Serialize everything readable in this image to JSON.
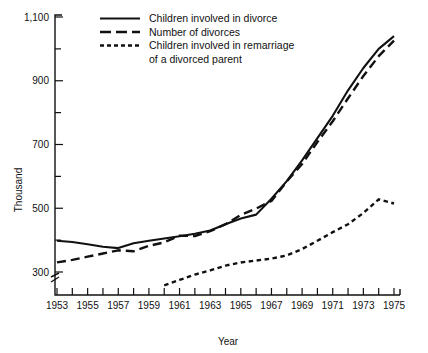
{
  "chart_data": {
    "type": "line",
    "title": "",
    "xlabel": "Year",
    "ylabel": "Thousand",
    "xlim": [
      1953,
      1975
    ],
    "ylim": [
      240,
      1100
    ],
    "grid": false,
    "legend_position": "top-center",
    "y_ticks_major": [
      300,
      500,
      700,
      900,
      1100
    ],
    "y_tick_labels": [
      "300",
      "500",
      "700",
      "900",
      "1,100"
    ],
    "y_ticks_minor": [
      400,
      600,
      800,
      1000
    ],
    "x_ticks": [
      1953,
      1954,
      1955,
      1956,
      1957,
      1958,
      1959,
      1960,
      1961,
      1962,
      1963,
      1964,
      1965,
      1966,
      1967,
      1968,
      1969,
      1970,
      1971,
      1972,
      1973,
      1974,
      1975
    ],
    "x_tick_labels": [
      "1953",
      "1955",
      "1957",
      "1959",
      "1961",
      "1963",
      "1965",
      "1967",
      "1969",
      "1971",
      "1973",
      "1975"
    ],
    "x_labeled_years": [
      1953,
      1955,
      1957,
      1959,
      1961,
      1963,
      1965,
      1967,
      1969,
      1971,
      1973,
      1975
    ],
    "axis_break": true,
    "series": [
      {
        "name": "Children involved in divorce",
        "style": "solid",
        "x": [
          1953,
          1954,
          1955,
          1956,
          1957,
          1958,
          1959,
          1960,
          1961,
          1962,
          1963,
          1964,
          1965,
          1966,
          1967,
          1968,
          1969,
          1970,
          1971,
          1972,
          1973,
          1974,
          1975
        ],
        "values": [
          398,
          394,
          387,
          379,
          375,
          390,
          398,
          405,
          412,
          420,
          430,
          450,
          468,
          480,
          530,
          585,
          650,
          720,
          790,
          870,
          940,
          1000,
          1040
        ]
      },
      {
        "name": "Number of divorces",
        "style": "dashed",
        "x": [
          1953,
          1954,
          1955,
          1956,
          1957,
          1958,
          1959,
          1960,
          1961,
          1962,
          1963,
          1964,
          1965,
          1966,
          1967,
          1968,
          1969,
          1970,
          1971,
          1972,
          1973,
          1974,
          1975
        ],
        "values": [
          330,
          338,
          348,
          358,
          368,
          365,
          382,
          393,
          414,
          413,
          428,
          450,
          479,
          499,
          523,
          584,
          639,
          708,
          773,
          845,
          915,
          977,
          1026
        ]
      },
      {
        "name": "Children involved in remarriage of a divorced parent",
        "style": "dotted",
        "x": [
          1960,
          1961,
          1962,
          1963,
          1964,
          1965,
          1966,
          1967,
          1968,
          1969,
          1970,
          1971,
          1972,
          1973,
          1974,
          1975
        ],
        "values": [
          258,
          275,
          292,
          305,
          320,
          330,
          336,
          342,
          352,
          372,
          398,
          425,
          450,
          485,
          528,
          515
        ]
      }
    ],
    "legend": [
      {
        "label": "Children involved in divorce",
        "style": "solid"
      },
      {
        "label": "Number of divorces",
        "style": "dashed"
      },
      {
        "label": "Children involved in remarriage",
        "style": "dotted"
      },
      {
        "label": "of a divorced parent",
        "style": "none"
      }
    ]
  }
}
